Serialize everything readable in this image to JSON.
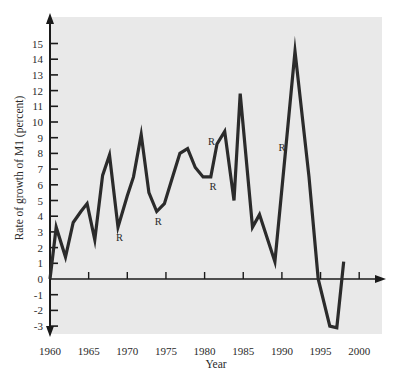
{
  "chart_data": {
    "type": "line",
    "title": "",
    "xlabel": "Year",
    "ylabel": "Rate of growth of M1 (percent)",
    "xlim": [
      1960,
      2002
    ],
    "ylim": [
      -3.5,
      15.5
    ],
    "grid": false,
    "legend": null,
    "x_ticks": [
      1960,
      1965,
      1970,
      1975,
      1980,
      1985,
      1990,
      1995,
      2000
    ],
    "x_tick_labels": [
      "1960",
      "1965",
      "1970",
      "1975",
      "1980",
      "1985",
      "1990",
      "1995",
      "2000"
    ],
    "y_ticks": [
      -3,
      -2,
      -1,
      0,
      1,
      2,
      3,
      4,
      5,
      6,
      7,
      8,
      9,
      10,
      11,
      12,
      13,
      14,
      15
    ],
    "y_tick_labels": [
      "-3",
      "-2",
      "-1",
      "0",
      "1",
      "2",
      "3",
      "4",
      "5",
      "6",
      "7",
      "8",
      "9",
      "10",
      "11",
      "12",
      "13",
      "14",
      "15"
    ],
    "series": [
      {
        "name": "M1 growth rate",
        "x": [
          1960,
          1960.8,
          1962,
          1963,
          1964,
          1964.8,
          1965.8,
          1966.8,
          1967.7,
          1968.8,
          1970,
          1970.8,
          1971.8,
          1972.8,
          1973.8,
          1974.8,
          1975.8,
          1976.8,
          1977.8,
          1978.8,
          1979.8,
          1980.8,
          1981.6,
          1982.6,
          1983.8,
          1984.6,
          1986.2,
          1987.1,
          1989.1,
          1990.4,
          1991.7,
          1993.5,
          1994.7,
          1996.2,
          1997.1,
          1998
        ],
        "values": [
          0,
          3.3,
          1.4,
          3.6,
          4.3,
          4.8,
          2.5,
          6.6,
          7.9,
          3.3,
          5.3,
          6.5,
          9.2,
          5.5,
          4.3,
          4.8,
          6.4,
          8.0,
          8.3,
          7.1,
          6.5,
          6.5,
          8.6,
          9.4,
          5.0,
          11.8,
          3.3,
          4.1,
          1.1,
          7.8,
          14.5,
          6.5,
          0,
          -3.0,
          -3.1,
          1.1
        ]
      }
    ],
    "annotations": [
      {
        "text": "R",
        "x": 1969,
        "y": 2.7,
        "meaning": "recession marker"
      },
      {
        "text": "R",
        "x": 1974,
        "y": 3.7
      },
      {
        "text": "R",
        "x": 1980.9,
        "y": 8.8
      },
      {
        "text": "R",
        "x": 1981.1,
        "y": 5.9
      },
      {
        "text": "R",
        "x": 1990,
        "y": 8.4
      }
    ],
    "colors": {
      "background_panel": "#e9e9e9",
      "line": "#2b2b2b",
      "axis": "#1a1a1a"
    }
  }
}
